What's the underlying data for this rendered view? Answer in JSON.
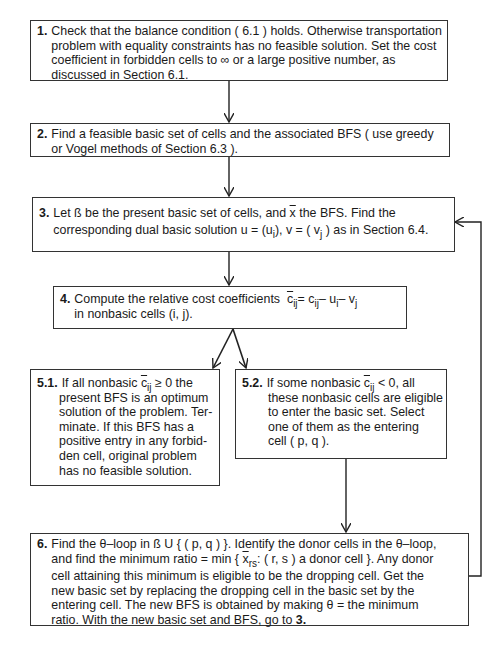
{
  "diagram": {
    "type": "flowchart",
    "steps": [
      {
        "id": "1",
        "number": "1.",
        "lines": [
          "Check that the balance condition ( 6.1 ) holds. Otherwise transportation",
          "problem with equality constraints has no feasible solution. Set the cost",
          "coefficient in forbidden cells to ∞ or a large positive number, as",
          "discussed in Section 6.1."
        ]
      },
      {
        "id": "2",
        "number": "2.",
        "lines": [
          "Find a feasible basic set of cells and the associated BFS ( use greedy",
          "or Vogel methods of Section 6.3 )."
        ]
      },
      {
        "id": "3",
        "number": "3.",
        "line1_a": "Let ß be the present basic set of cells, and ",
        "line1_xbar": "x",
        "line1_b": " the BFS. Find the",
        "line2_a": "corresponding dual basic solution u = (u",
        "line2_sub_i": "i",
        "line2_b": "), v = ( v",
        "line2_sub_j": "j",
        "line2_c": " ) as in Section 6.4."
      },
      {
        "id": "4",
        "number": "4.",
        "line1": "Compute the relative cost coefficients",
        "formula": {
          "cbar": "c",
          "sub_ij": "ij",
          "eq": "= c",
          "sub_ij2": "ij",
          "minus_u": "– u",
          "sub_i": "i",
          "minus_v": "– v",
          "sub_j": "j"
        },
        "line2": "in nonbasic cells (i, j)."
      },
      {
        "id": "5.1",
        "number": "5.1.",
        "line1_a": "If all nonbasic ",
        "cbar": "c",
        "sub_ij": "ij",
        "line1_b": " ≥ 0 the",
        "lines": [
          "present BFS is an optimum",
          "solution of the problem. Ter-",
          "minate. If this BFS has a",
          "positive entry in any forbid-",
          "den cell, original problem",
          "has no feasible solution."
        ]
      },
      {
        "id": "5.2",
        "number": "5.2.",
        "line1_a": "If some nonbasic ",
        "cbar": "c",
        "sub_ij": "ij",
        "line1_b": " < 0, all",
        "lines": [
          "these nonbasic cells are eligible",
          "to enter the basic set. Select",
          "one of them as the entering",
          "cell ( p, q )."
        ]
      },
      {
        "id": "6",
        "number": "6.",
        "line1": "Find the θ–loop in ß U { ( p, q ) }. Identify the donor cells in the θ–loop,",
        "line2_a": "and find the minimum ratio = min { ",
        "line2_xbar": "x",
        "line2_sub": "rs",
        "line2_b": ": ( r, s ) a donor cell }. Any donor",
        "lines": [
          "cell attaining this minimum is eligible to be the dropping cell. Get the",
          "new basic set by replacing the dropping cell in the basic set by the",
          "entering cell. The new BFS is obtained by making θ = the minimum"
        ],
        "last_a": "ratio. With the new basic set and BFS, go to ",
        "last_ref": "3."
      }
    ],
    "edges": [
      {
        "from": "1",
        "to": "2"
      },
      {
        "from": "2",
        "to": "3"
      },
      {
        "from": "3",
        "to": "4"
      },
      {
        "from": "4",
        "to": "5.1"
      },
      {
        "from": "4",
        "to": "5.2"
      },
      {
        "from": "5.2",
        "to": "6"
      },
      {
        "from": "6",
        "to": "3",
        "label": "loop back"
      }
    ],
    "colors": {
      "line": "#222222",
      "border": "#333333",
      "background": "#ffffff"
    }
  }
}
